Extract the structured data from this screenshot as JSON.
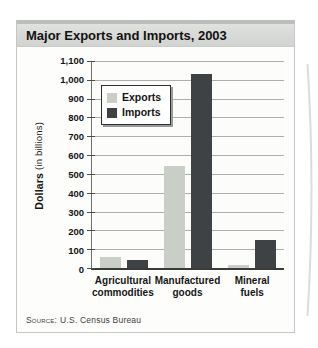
{
  "card": {
    "title": "Major Exports and Imports, 2003"
  },
  "source": {
    "label": "Source:",
    "text": "U.S. Census Bureau"
  },
  "chart_data": {
    "type": "bar",
    "title": "Major Exports and Imports, 2003",
    "categories": [
      "Agricultural commodities",
      "Manufactured goods",
      "Mineral fuels"
    ],
    "category_lines": [
      [
        "Agricultural",
        "commodities"
      ],
      [
        "Manufactured",
        "goods"
      ],
      [
        "Mineral",
        "fuels"
      ]
    ],
    "series": [
      {
        "name": "Exports",
        "color": "#c9cec7",
        "values": [
          60,
          540,
          15
        ]
      },
      {
        "name": "Imports",
        "color": "#3e4245",
        "values": [
          45,
          1030,
          150
        ]
      }
    ],
    "ylabel": "Dollars (in billions)",
    "ylabel_bold": "Dollars",
    "ylabel_rest": " (in billions)",
    "ylim": [
      0,
      1100
    ],
    "yticks": [
      0,
      100,
      200,
      300,
      400,
      500,
      600,
      700,
      800,
      900,
      1000,
      1100
    ],
    "ytick_labels": [
      "0",
      "100",
      "200",
      "300",
      "400",
      "500",
      "600",
      "700",
      "800",
      "900",
      "1,000",
      "1,100"
    ],
    "grid": true,
    "legend_position": "upper-left",
    "source": "SOURCE: U.S. Census Bureau",
    "colors": {
      "exports_bar": "#c9cec7",
      "imports_bar": "#3e4245",
      "gridline": "#acb0ac",
      "axis": "#3a3c3a",
      "title_bar_bg": "#d6d8d5"
    }
  }
}
